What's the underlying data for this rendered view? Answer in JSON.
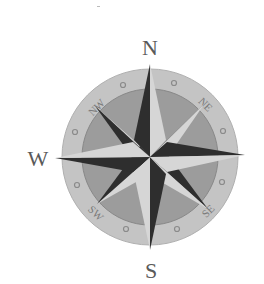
{
  "compass": {
    "cardinal_labels": {
      "north": "N",
      "south": "S",
      "west": "W"
    },
    "ordinal_labels": {
      "northeast": "NE",
      "northwest": "NW",
      "southeast": "SE",
      "southwest": "SW"
    },
    "colors": {
      "background": "#ffffff",
      "outer_ring": "#c4c4c4",
      "inner_disc": "#9c9c9c",
      "point_dark": "#2e2e2e",
      "point_light": "#d6d6d6",
      "label": "#5a5a5a"
    }
  }
}
